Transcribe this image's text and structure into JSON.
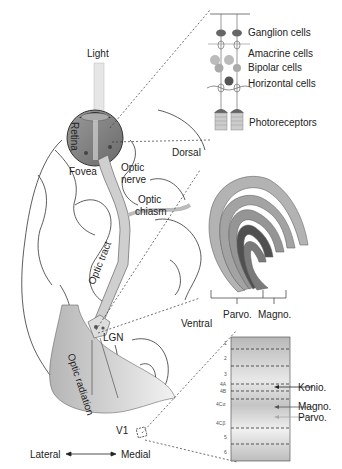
{
  "diagram": {
    "type": "visual-pathway-anatomy",
    "eye": {
      "light_label": "Light",
      "retina_label": "Retina",
      "fovea_label": "Fovea",
      "optic_nerve_label": [
        "Optic",
        "nerve"
      ],
      "optic_chiasm_label": [
        "Optic",
        "chiasm"
      ]
    },
    "pathway": {
      "optic_tract_label": "Optic tract",
      "lgn_label": "LGN",
      "optic_radiation_label": "Optic radiation",
      "v1_label": "V1"
    },
    "orientation": {
      "lateral": "Lateral",
      "medial": "Medial"
    },
    "retina_inset": {
      "layers": [
        "Ganglion cells",
        "Amacrine cells",
        "Bipolar cells",
        "Horizontal cells",
        "Photoreceptors"
      ]
    },
    "lgn_inset": {
      "dorsal": "Dorsal",
      "ventral": "Ventral",
      "parvo": "Parvo.",
      "magno": "Magno."
    },
    "v1_inset": {
      "layer_numbers": [
        "1",
        "2",
        "3",
        "4A",
        "4B",
        "4Cα",
        "4Cβ",
        "5",
        "6"
      ],
      "inputs": [
        "Konio.",
        "Magno.",
        "Parvo."
      ]
    },
    "colors": {
      "tissue_gray": "#bdbdbd",
      "dark_gray": "#555555",
      "light_beam": "#e6e6e6"
    }
  }
}
